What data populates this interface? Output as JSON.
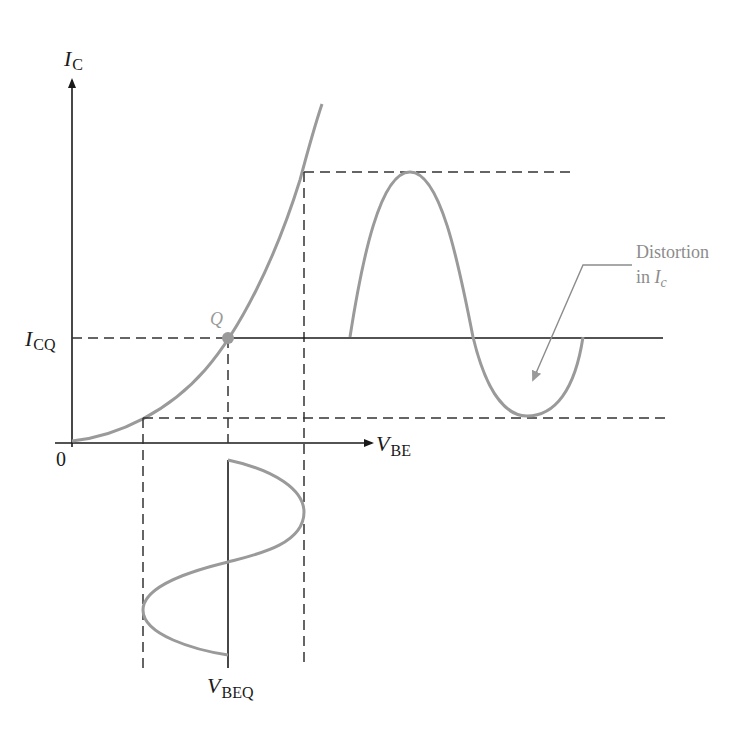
{
  "diagram": {
    "y_axis": {
      "label_main": "I",
      "label_sub": "C"
    },
    "x_axis": {
      "label_main": "V",
      "label_sub": "BE"
    },
    "origin_label": "0",
    "icq_label": {
      "main": "I",
      "sub": "CQ"
    },
    "q_point_label": "Q",
    "vbeq_label": {
      "main": "V",
      "sub": "BEQ"
    },
    "annotation": {
      "line1": "Distortion",
      "line2_prefix": "in ",
      "line2_main": "I",
      "line2_sub": "c"
    },
    "colors": {
      "axis": "#1a1a1a",
      "curve": "#9a9a9a",
      "dashed": "#333333",
      "annotation_text": "#8c8c8c",
      "q_point": "#9a9a9a"
    }
  }
}
